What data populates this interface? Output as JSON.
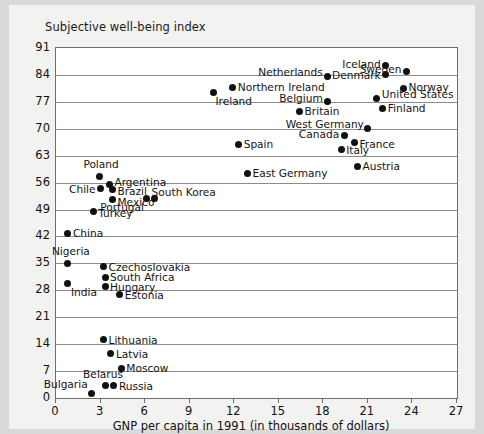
{
  "chart_data": {
    "type": "scatter",
    "title": "Subjective well-being index",
    "xlabel": "GNP per capita in 1991 (in thousands of dollars)",
    "ylabel": "Subjective well-being index",
    "xlim": [
      0,
      27
    ],
    "ylim": [
      0,
      91
    ],
    "xticks": [
      0,
      3,
      6,
      9,
      12,
      15,
      18,
      21,
      24,
      27
    ],
    "yticks": [
      0,
      7,
      14,
      21,
      28,
      35,
      42,
      49,
      56,
      63,
      70,
      77,
      84,
      91
    ],
    "grid": "horizontal",
    "legend": "none",
    "points": [
      {
        "label": "Iceland",
        "x": 22.2,
        "y": 86.5,
        "lab_pos": "left",
        "dx": -5,
        "dy": -1
      },
      {
        "label": "Sweden",
        "x": 23.6,
        "y": 85.0,
        "lab_pos": "left",
        "dx": -5,
        "dy": -2
      },
      {
        "label": "Denmark",
        "x": 22.2,
        "y": 84.0,
        "lab_pos": "left",
        "dx": -5,
        "dy": 0
      },
      {
        "label": "Netherlands",
        "x": 18.3,
        "y": 83.5,
        "lab_pos": "left",
        "dx": -5,
        "dy": -5
      },
      {
        "label": "Norway",
        "x": 23.4,
        "y": 80.5,
        "lab_pos": "right",
        "dx": 5,
        "dy": -1
      },
      {
        "label": "Northern Ireland",
        "x": 11.9,
        "y": 80.8,
        "lab_pos": "right",
        "dx": 5,
        "dy": 0
      },
      {
        "label": "Ireland",
        "x": 10.6,
        "y": 79.4,
        "lab_pos": "right",
        "dx": 2,
        "dy": 8
      },
      {
        "label": "United States",
        "x": 21.6,
        "y": 77.9,
        "lab_pos": "right",
        "dx": 5,
        "dy": -4
      },
      {
        "label": "Belgium",
        "x": 18.3,
        "y": 77.0,
        "lab_pos": "left",
        "dx": -5,
        "dy": -4
      },
      {
        "label": "Finland",
        "x": 22.0,
        "y": 75.3,
        "lab_pos": "right",
        "dx": 5,
        "dy": 0
      },
      {
        "label": "Britain",
        "x": 16.4,
        "y": 74.5,
        "lab_pos": "right",
        "dx": 5,
        "dy": 0
      },
      {
        "label": "West Germany",
        "x": 21.0,
        "y": 70.0,
        "lab_pos": "left",
        "dx": -4,
        "dy": -5
      },
      {
        "label": "Canada",
        "x": 19.4,
        "y": 68.2,
        "lab_pos": "left",
        "dx": -5,
        "dy": -2
      },
      {
        "label": "France",
        "x": 20.1,
        "y": 66.4,
        "lab_pos": "right",
        "dx": 5,
        "dy": 1
      },
      {
        "label": "Spain",
        "x": 12.3,
        "y": 66.0,
        "lab_pos": "right",
        "dx": 5,
        "dy": 0
      },
      {
        "label": "Italy",
        "x": 19.2,
        "y": 64.5,
        "lab_pos": "right",
        "dx": 5,
        "dy": 0
      },
      {
        "label": "Austria",
        "x": 20.3,
        "y": 60.3,
        "lab_pos": "right",
        "dx": 5,
        "dy": 0
      },
      {
        "label": "East Germany",
        "x": 12.9,
        "y": 58.4,
        "lab_pos": "right",
        "dx": 5,
        "dy": 0
      },
      {
        "label": "Poland",
        "x": 2.9,
        "y": 57.6,
        "lab_pos": "top",
        "dx": 2,
        "dy": -6
      },
      {
        "label": "Argentina",
        "x": 3.6,
        "y": 55.4,
        "lab_pos": "right",
        "dx": 5,
        "dy": -3
      },
      {
        "label": "Chile",
        "x": 3.0,
        "y": 54.4,
        "lab_pos": "left",
        "dx": -5,
        "dy": 0
      },
      {
        "label": "Brazil",
        "x": 3.8,
        "y": 54.1,
        "lab_pos": "right",
        "dx": 5,
        "dy": 1
      },
      {
        "label": "Mexico",
        "x": 3.8,
        "y": 51.5,
        "lab_pos": "right",
        "dx": 5,
        "dy": 2
      },
      {
        "label": "South Korea",
        "x": 6.1,
        "y": 51.8,
        "lab_pos": "right",
        "dx": 5,
        "dy": -7
      },
      {
        "label": "Portugal",
        "x": 6.6,
        "y": 51.8,
        "lab_pos": "left",
        "dx": -10,
        "dy": 8
      },
      {
        "label": "Turkey",
        "x": 2.5,
        "y": 48.5,
        "lab_pos": "right",
        "dx": 5,
        "dy": 2
      },
      {
        "label": "China",
        "x": 0.8,
        "y": 42.9,
        "lab_pos": "right",
        "dx": 5,
        "dy": 0
      },
      {
        "label": "Nigeria",
        "x": 0.8,
        "y": 35.0,
        "lab_pos": "top",
        "dx": 3,
        "dy": -6
      },
      {
        "label": "Czechoslovakia",
        "x": 3.2,
        "y": 34.1,
        "lab_pos": "right",
        "dx": 5,
        "dy": 0
      },
      {
        "label": "South Africa",
        "x": 3.3,
        "y": 31.4,
        "lab_pos": "right",
        "dx": 5,
        "dy": 0
      },
      {
        "label": "Hungary",
        "x": 3.3,
        "y": 28.9,
        "lab_pos": "right",
        "dx": 5,
        "dy": 0
      },
      {
        "label": "India",
        "x": 0.8,
        "y": 29.8,
        "lab_pos": "right",
        "dx": 3,
        "dy": 9
      },
      {
        "label": "Estonia",
        "x": 4.3,
        "y": 26.9,
        "lab_pos": "right",
        "dx": 5,
        "dy": 0
      },
      {
        "label": "Lithuania",
        "x": 3.2,
        "y": 15.2,
        "lab_pos": "right",
        "dx": 5,
        "dy": 0
      },
      {
        "label": "Latvia",
        "x": 3.7,
        "y": 11.5,
        "lab_pos": "right",
        "dx": 5,
        "dy": 0
      },
      {
        "label": "Moscow",
        "x": 4.4,
        "y": 7.8,
        "lab_pos": "right",
        "dx": 5,
        "dy": 0
      },
      {
        "label": "Belarus",
        "x": 3.3,
        "y": 3.2,
        "lab_pos": "top",
        "dx": -2,
        "dy": -6
      },
      {
        "label": "Bulgaria",
        "x": 2.4,
        "y": 1.2,
        "lab_pos": "left",
        "dx": -4,
        "dy": -9
      },
      {
        "label": "Russia",
        "x": 3.9,
        "y": 3.2,
        "lab_pos": "right",
        "dx": 5,
        "dy": 0
      }
    ]
  },
  "colors": {
    "page_background": "#d9d9d9",
    "panel_background": "#f2f2f0",
    "plot_background": "#ffffff",
    "grid": "#8c8c8c",
    "frame": "#6e6e6e",
    "dot": "#111111",
    "text": "#141414"
  }
}
